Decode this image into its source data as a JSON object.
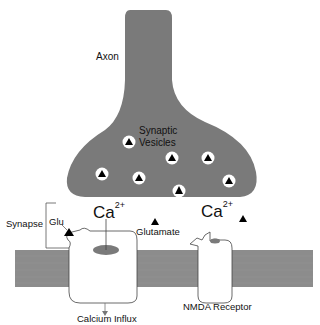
{
  "diagram": {
    "title": "",
    "labels": {
      "axon": "Axon",
      "vesicles_line1": "Synaptic",
      "vesicles_line2": "Vesicles",
      "synapse": "Synapse",
      "glu": "Glu",
      "calcium_left": "Ca",
      "calcium_right": "Ca",
      "calcium_charge": "2+",
      "glutamate": "Glutamate",
      "calcium_influx": "Calcium Influx",
      "nmda_receptor": "NMDA Receptor"
    },
    "colors": {
      "axon_fill": "#7a7a7a",
      "membrane_fill": "#8c8c8c",
      "vesicle_fill": "#ffffff",
      "glutamate_triangle": "#000000",
      "receptor_fill": "#ffffff",
      "channel_pore": "#7a7a7a",
      "text": "#111111"
    },
    "vesicles": [
      {
        "cx": 129,
        "cy": 142
      },
      {
        "cx": 172,
        "cy": 158
      },
      {
        "cx": 208,
        "cy": 158
      },
      {
        "cx": 102,
        "cy": 174
      },
      {
        "cx": 139,
        "cy": 178
      },
      {
        "cx": 229,
        "cy": 181
      },
      {
        "cx": 179,
        "cy": 190
      }
    ]
  }
}
